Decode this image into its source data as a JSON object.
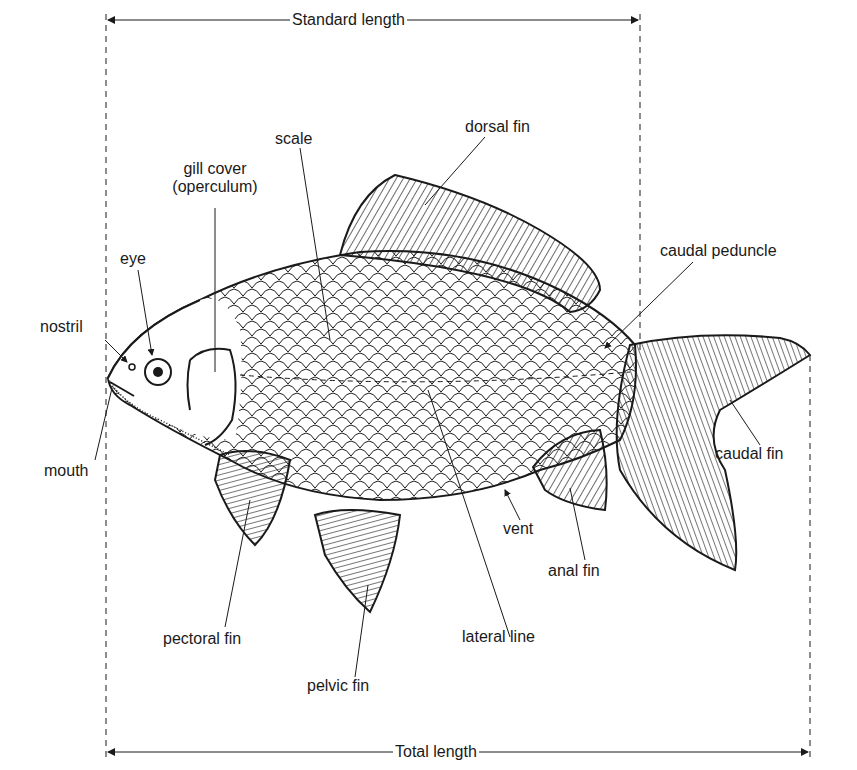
{
  "figure": {
    "stroke_color": "#1a1a1a",
    "background": "#ffffff"
  },
  "dimensions": {
    "standard_length": "Standard length",
    "total_length": "Total length"
  },
  "labels": {
    "dorsal_fin": "dorsal fin",
    "scale": "scale",
    "gill_cover_line1": "gill cover",
    "gill_cover_line2": "(operculum)",
    "eye": "eye",
    "nostril": "nostril",
    "mouth": "mouth",
    "caudal_peduncle": "caudal peduncle",
    "caudal_fin": "caudal fin",
    "vent": "vent",
    "anal_fin": "anal fin",
    "lateral_line": "lateral line",
    "pectoral_fin": "pectoral fin",
    "pelvic_fin": "pelvic fin"
  }
}
